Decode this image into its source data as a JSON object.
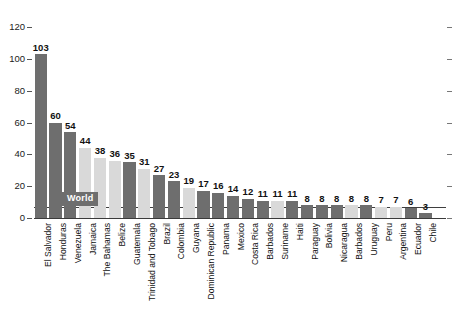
{
  "chart_data": {
    "type": "bar",
    "title": "",
    "subtitle": "",
    "xlabel": "",
    "ylabel": "",
    "ylim": [
      0,
      120
    ],
    "y_ticks": [
      0,
      20,
      40,
      60,
      80,
      100,
      120
    ],
    "grid": false,
    "legend": "none",
    "reference_line": {
      "label": "World",
      "value": 7
    },
    "categories": [
      "El Salvador",
      "Honduras",
      "Venezuela",
      "Jamaica",
      "The Bahamas",
      "Belize",
      "Guatemala",
      "Trinidad and Tobago",
      "Brazil",
      "Colombia",
      "Guyana",
      "Dominican Republic",
      "Panama",
      "Mexico",
      "Costa Rica",
      "Barbados",
      "Suriname",
      "Haiti",
      "Paraguay",
      "Bolivia",
      "Nicaragua",
      "Barbados",
      "Uruguay",
      "Peru",
      "Argentina",
      "Ecuador",
      "Chile"
    ],
    "values": [
      103,
      60,
      54,
      44,
      38,
      36,
      35,
      31,
      27,
      23,
      19,
      17,
      16,
      14,
      12,
      11,
      11,
      11,
      8,
      8,
      8,
      8,
      8,
      7,
      7,
      6,
      3
    ],
    "bar_shades": [
      "dark",
      "dark",
      "dark",
      "light",
      "light",
      "light",
      "dark",
      "light",
      "dark",
      "dark",
      "light",
      "dark",
      "dark",
      "dark",
      "dark",
      "dark",
      "light",
      "dark",
      "dark",
      "dark",
      "dark",
      "light",
      "dark",
      "light",
      "light",
      "dark",
      "dark"
    ],
    "colors": {
      "bar_dark": "#6e6e6e",
      "bar_light": "#d9d9d9",
      "axis": "#3a3a3a",
      "text": "#111111",
      "badge_bg": "#6e6e6e",
      "badge_text": "#ffffff",
      "background": "#ffffff"
    }
  }
}
